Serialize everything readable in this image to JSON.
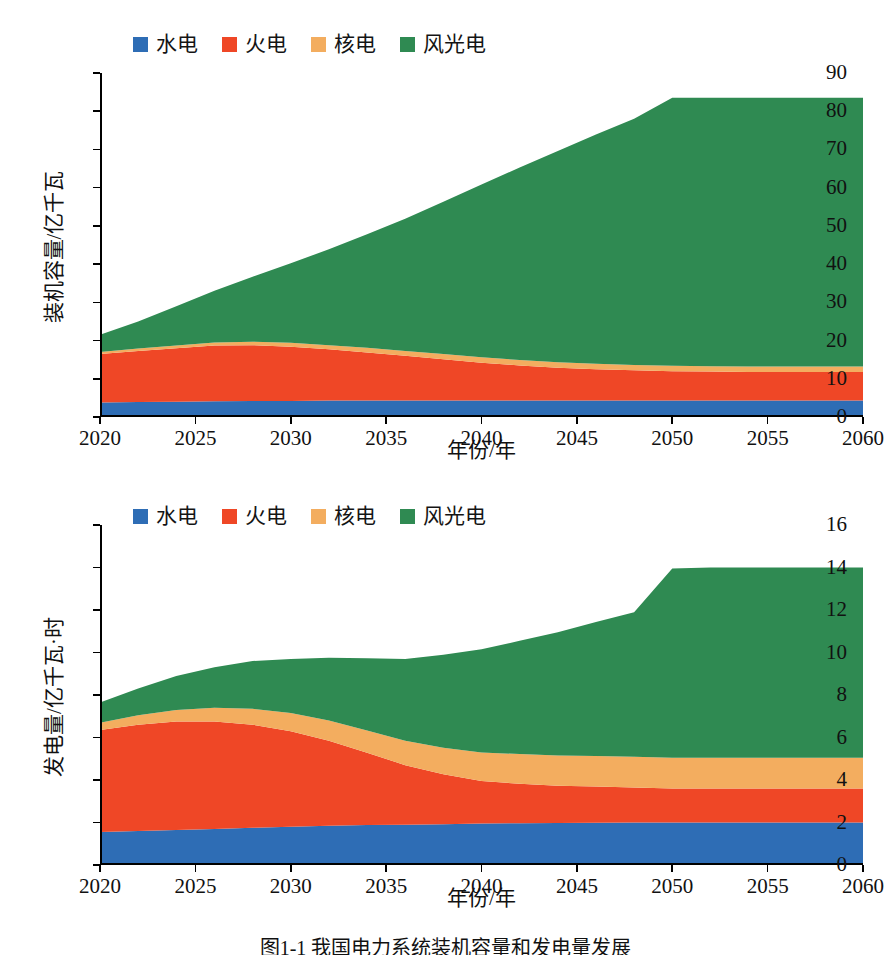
{
  "caption": "图1-1  我国电力系统装机容量和发电量发展",
  "colors": {
    "hydro": "#2e6db5",
    "thermal": "#ef4726",
    "nuclear": "#f3ad5f",
    "windsolar": "#2f8a52",
    "axis": "#000000",
    "text": "#111111",
    "background": "#ffffff"
  },
  "legend": {
    "items": [
      {
        "label": "水电",
        "color": "#2e6db5",
        "key": "hydro"
      },
      {
        "label": "火电",
        "color": "#ef4726",
        "key": "thermal"
      },
      {
        "label": "核电",
        "color": "#f3ad5f",
        "key": "nuclear"
      },
      {
        "label": "风光电",
        "color": "#2f8a52",
        "key": "windsolar"
      }
    ]
  },
  "chart_data": [
    {
      "id": "installed-capacity",
      "type": "area",
      "stacked": true,
      "title": "",
      "xlabel": "年份/年",
      "ylabel": "装机容量/亿千瓦",
      "xlim": [
        2020,
        2060
      ],
      "ylim": [
        0,
        90
      ],
      "xticks": [
        2020,
        2025,
        2030,
        2035,
        2040,
        2045,
        2050,
        2055,
        2060
      ],
      "yticks": [
        0,
        10,
        20,
        30,
        40,
        50,
        60,
        70,
        80,
        90
      ],
      "grid": false,
      "legend_position": "top-left",
      "x": [
        2020,
        2022,
        2024,
        2026,
        2028,
        2030,
        2032,
        2034,
        2036,
        2038,
        2040,
        2042,
        2044,
        2046,
        2048,
        2050,
        2052,
        2054,
        2056,
        2058,
        2060
      ],
      "series": [
        {
          "name": "水电",
          "color": "#2e6db5",
          "values": [
            3.8,
            3.9,
            4.0,
            4.1,
            4.2,
            4.2,
            4.3,
            4.3,
            4.3,
            4.3,
            4.3,
            4.3,
            4.3,
            4.3,
            4.3,
            4.3,
            4.3,
            4.3,
            4.3,
            4.3,
            4.3
          ]
        },
        {
          "name": "火电",
          "color": "#ef4726",
          "values": [
            12.7,
            13.4,
            14.0,
            14.6,
            14.6,
            14.2,
            13.4,
            12.6,
            11.7,
            10.8,
            9.9,
            9.2,
            8.6,
            8.2,
            7.9,
            7.7,
            7.6,
            7.5,
            7.5,
            7.5,
            7.5
          ]
        },
        {
          "name": "核电",
          "color": "#f3ad5f",
          "values": [
            0.5,
            0.6,
            0.7,
            0.8,
            0.9,
            1.0,
            1.1,
            1.2,
            1.3,
            1.4,
            1.4,
            1.4,
            1.4,
            1.4,
            1.4,
            1.4,
            1.4,
            1.4,
            1.4,
            1.4,
            1.4
          ]
        },
        {
          "name": "风光电",
          "color": "#2f8a52",
          "values": [
            4.5,
            7.1,
            10.3,
            13.5,
            17.0,
            20.8,
            25.1,
            29.7,
            34.6,
            39.8,
            45.2,
            50.4,
            55.3,
            60.0,
            64.4,
            70.1,
            70.2,
            70.3,
            70.3,
            70.3,
            70.3
          ]
        }
      ],
      "stack_tops_2020": {
        "hydro": 3.8,
        "thermal": 16.5,
        "nuclear": 17.0,
        "windsolar": 21.5
      },
      "stack_tops_2060": {
        "hydro": 4.3,
        "thermal": 11.8,
        "nuclear": 13.2,
        "windsolar": 83.5
      },
      "total_peak": 83.5
    },
    {
      "id": "power-generation",
      "type": "area",
      "stacked": true,
      "title": "",
      "xlabel": "年份/年",
      "ylabel": "发电量/亿千瓦·时",
      "xlim": [
        2020,
        2060
      ],
      "ylim": [
        0,
        16
      ],
      "xticks": [
        2020,
        2025,
        2030,
        2035,
        2040,
        2045,
        2050,
        2055,
        2060
      ],
      "yticks": [
        0,
        2,
        4,
        6,
        8,
        10,
        12,
        14,
        16
      ],
      "grid": false,
      "legend_position": "top-left",
      "x": [
        2020,
        2022,
        2024,
        2026,
        2028,
        2030,
        2032,
        2034,
        2036,
        2038,
        2040,
        2042,
        2044,
        2046,
        2048,
        2050,
        2052,
        2054,
        2056,
        2058,
        2060
      ],
      "series": [
        {
          "name": "水电",
          "color": "#2e6db5",
          "values": [
            1.55,
            1.6,
            1.65,
            1.7,
            1.75,
            1.8,
            1.85,
            1.88,
            1.9,
            1.92,
            1.95,
            1.97,
            1.98,
            1.99,
            2.0,
            2.0,
            2.0,
            2.0,
            2.0,
            2.0,
            2.0
          ]
        },
        {
          "name": "火电",
          "color": "#ef4726",
          "values": [
            4.8,
            5.0,
            5.1,
            5.05,
            4.85,
            4.5,
            4.0,
            3.4,
            2.8,
            2.35,
            2.0,
            1.85,
            1.75,
            1.7,
            1.65,
            1.6,
            1.6,
            1.6,
            1.6,
            1.6,
            1.6
          ]
        },
        {
          "name": "核电",
          "color": "#f3ad5f",
          "values": [
            0.35,
            0.45,
            0.55,
            0.65,
            0.75,
            0.85,
            0.95,
            1.05,
            1.15,
            1.25,
            1.35,
            1.4,
            1.42,
            1.44,
            1.45,
            1.45,
            1.45,
            1.45,
            1.45,
            1.45,
            1.45
          ]
        },
        {
          "name": "风光电",
          "color": "#2f8a52",
          "values": [
            0.95,
            1.25,
            1.6,
            1.9,
            2.25,
            2.55,
            2.95,
            3.4,
            3.85,
            4.38,
            4.85,
            5.33,
            5.8,
            6.3,
            6.8,
            8.9,
            8.95,
            8.95,
            8.95,
            8.95,
            8.95
          ]
        }
      ],
      "stack_tops_2020": {
        "hydro": 1.55,
        "thermal": 6.35,
        "nuclear": 6.7,
        "windsolar": 7.65
      },
      "stack_tops_2060": {
        "hydro": 2.0,
        "thermal": 3.6,
        "nuclear": 5.05,
        "windsolar": 14.0
      },
      "total_peak": 14.0
    }
  ]
}
